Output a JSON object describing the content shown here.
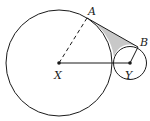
{
  "diagram": {
    "labels": {
      "A": "A",
      "B": "B",
      "X": "X",
      "Y": "Y"
    },
    "cropped_header_text": "",
    "colors": {
      "stroke": "#1a1a1a",
      "shaded_region": "#c8c8c8",
      "background": "#ffffff"
    },
    "elements": [
      {
        "type": "circle",
        "center": "X",
        "description": "large circle"
      },
      {
        "type": "circle",
        "center": "Y",
        "description": "small circle"
      },
      {
        "type": "segment",
        "from": "X",
        "to": "A",
        "style": "dashed",
        "description": "radius XA"
      },
      {
        "type": "segment",
        "from": "X",
        "to": "Y",
        "style": "solid"
      },
      {
        "type": "segment",
        "from": "Y",
        "to": "B",
        "style": "solid",
        "description": "radius YB"
      },
      {
        "type": "segment",
        "from": "A",
        "to": "B",
        "style": "solid",
        "description": "common tangent AB"
      },
      {
        "type": "region",
        "description": "shaded region bounded by tangent AB and the two circles"
      }
    ]
  }
}
